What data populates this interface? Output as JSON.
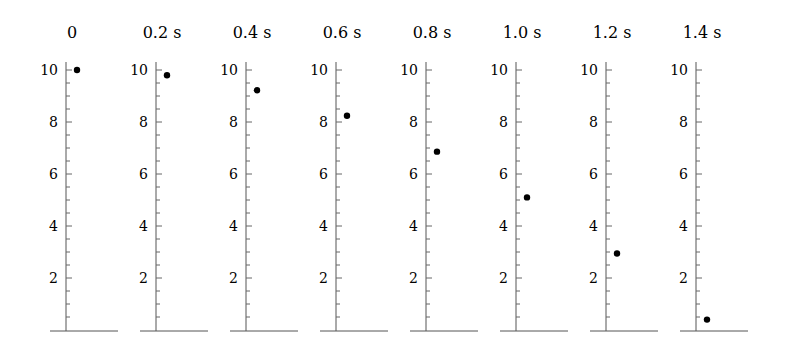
{
  "figure": {
    "y_axis": {
      "min": 0,
      "max": 10,
      "labels": [
        2,
        4,
        6,
        8,
        10
      ],
      "minor_step": 0.5
    },
    "panels": [
      {
        "title": "0",
        "height": 10.0
      },
      {
        "title": "0.2 s",
        "height": 9.8
      },
      {
        "title": "0.4 s",
        "height": 9.22
      },
      {
        "title": "0.6 s",
        "height": 8.24
      },
      {
        "title": "0.8 s",
        "height": 6.86
      },
      {
        "title": "1.0 s",
        "height": 5.1
      },
      {
        "title": "1.2 s",
        "height": 2.94
      },
      {
        "title": "1.4 s",
        "height": 0.4
      }
    ]
  },
  "chart_data": {
    "type": "scatter",
    "title": "",
    "categories": [
      "0",
      "0.2 s",
      "0.4 s",
      "0.6 s",
      "0.8 s",
      "1.0 s",
      "1.2 s",
      "1.4 s"
    ],
    "x": [
      0,
      0.2,
      0.4,
      0.6,
      0.8,
      1.0,
      1.2,
      1.4
    ],
    "values": [
      10.0,
      9.8,
      9.22,
      8.24,
      6.86,
      5.1,
      2.94,
      0.4
    ],
    "xlabel": "time",
    "ylabel": "height",
    "ylim": [
      0,
      10
    ],
    "yticks": [
      2,
      4,
      6,
      8,
      10
    ],
    "grid": false
  }
}
